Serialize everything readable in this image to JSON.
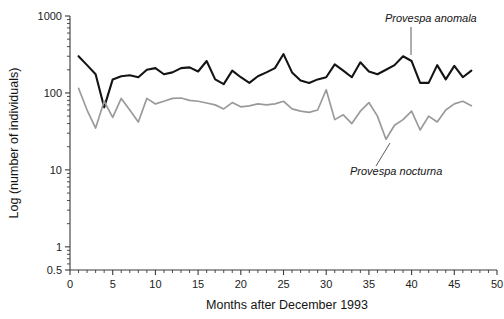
{
  "chart_data": {
    "type": "line",
    "title": "",
    "xlabel": "Months after December 1993",
    "ylabel": "Log (number of individuals)",
    "yscale": "log",
    "ylim": [
      0.5,
      1000
    ],
    "xlim": [
      0,
      50
    ],
    "grid": false,
    "legend_position": "inline-annotation",
    "y_tick_labels": [
      "1000",
      "100",
      "10",
      "1",
      "0.5"
    ],
    "y_tick_values": [
      1000,
      100,
      10,
      1,
      0.5
    ],
    "x_tick_labels": [
      "0",
      "5",
      "10",
      "15",
      "20",
      "25",
      "30",
      "35",
      "40",
      "45",
      "50"
    ],
    "x_tick_values": [
      0,
      5,
      10,
      15,
      20,
      25,
      30,
      35,
      40,
      45,
      50
    ],
    "x_minor_tick_interval": 1,
    "x": [
      1,
      2,
      3,
      4,
      5,
      6,
      7,
      8,
      9,
      10,
      11,
      12,
      13,
      14,
      15,
      16,
      17,
      18,
      19,
      20,
      21,
      22,
      23,
      24,
      25,
      26,
      27,
      28,
      29,
      30,
      31,
      32,
      33,
      34,
      35,
      36,
      37,
      38,
      39,
      40,
      41,
      42,
      43,
      44,
      45,
      46,
      47
    ],
    "series": [
      {
        "name": "Provespa anomala",
        "color": "#141414",
        "annotation_label": "Provespa anomala",
        "values": [
          300,
          230,
          175,
          65,
          150,
          165,
          170,
          160,
          200,
          210,
          175,
          185,
          210,
          215,
          190,
          260,
          150,
          130,
          195,
          160,
          135,
          165,
          185,
          210,
          320,
          185,
          145,
          135,
          150,
          160,
          235,
          195,
          160,
          250,
          190,
          175,
          200,
          230,
          300,
          260,
          135,
          135,
          230,
          150,
          225,
          160,
          195
        ]
      },
      {
        "name": "Provespa nocturna",
        "color": "#9a9a9a",
        "annotation_label": "Provespa nocturna",
        "values": [
          115,
          60,
          35,
          78,
          48,
          85,
          60,
          42,
          85,
          72,
          78,
          85,
          86,
          80,
          78,
          74,
          70,
          62,
          75,
          66,
          68,
          72,
          70,
          72,
          78,
          62,
          58,
          56,
          60,
          110,
          45,
          52,
          40,
          58,
          75,
          50,
          25,
          38,
          45,
          58,
          33,
          50,
          42,
          60,
          72,
          78,
          68
        ]
      }
    ],
    "annotations": [
      {
        "text": "Provespa anomala",
        "x_px": 385,
        "y_px": 22,
        "leader_to_x_px": 411,
        "leader_to_y_px": 55
      },
      {
        "text": "Provespa nocturna",
        "x_px": 350,
        "y_px": 175,
        "leader_to_x_px": 390,
        "leader_to_y_px": 143
      }
    ]
  }
}
